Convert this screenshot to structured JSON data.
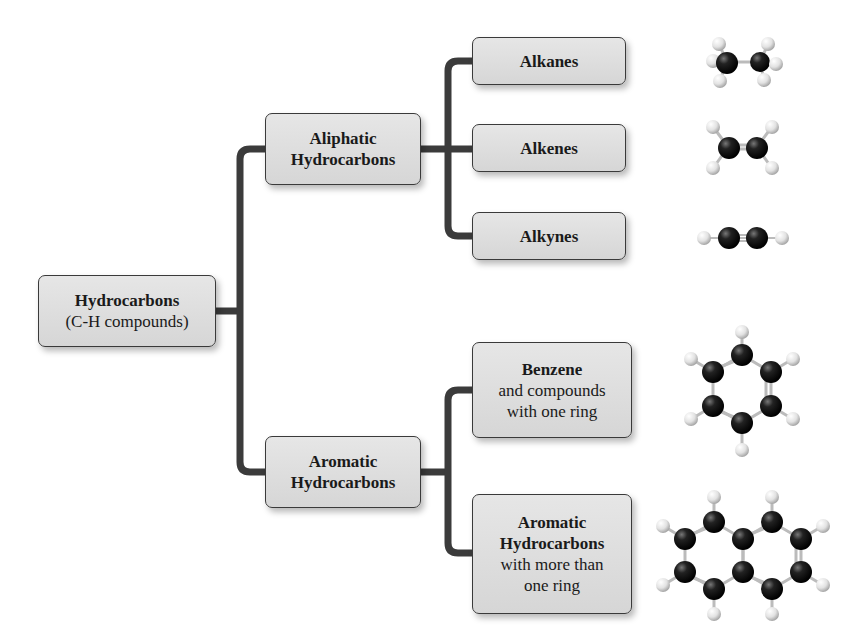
{
  "diagram": {
    "colors": {
      "box_fill": "#dcdcdc",
      "box_border": "#3a3a3a",
      "connector": "#3b3b3b",
      "carbon_atom": "#111111",
      "hydrogen_atom": "#e8e8e8",
      "background": "#ffffff"
    },
    "root": {
      "title": "Hydrocarbons",
      "subtitle": "(C-H compounds)"
    },
    "branches": [
      {
        "title_line1": "Aliphatic",
        "title_line2": "Hydrocarbons",
        "children": [
          {
            "title": "Alkanes",
            "molecule": "ethane-model"
          },
          {
            "title": "Alkenes",
            "molecule": "ethene-model"
          },
          {
            "title": "Alkynes",
            "molecule": "ethyne-model"
          }
        ]
      },
      {
        "title_line1": "Aromatic",
        "title_line2": "Hydrocarbons",
        "children": [
          {
            "title": "Benzene",
            "desc_line1": "and compounds",
            "desc_line2": "with one ring",
            "molecule": "benzene-model"
          },
          {
            "title_line1": "Aromatic",
            "title_line2": "Hydrocarbons",
            "desc_line1": "with more than",
            "desc_line2": "one ring",
            "molecule": "naphthalene-model"
          }
        ]
      }
    ]
  }
}
